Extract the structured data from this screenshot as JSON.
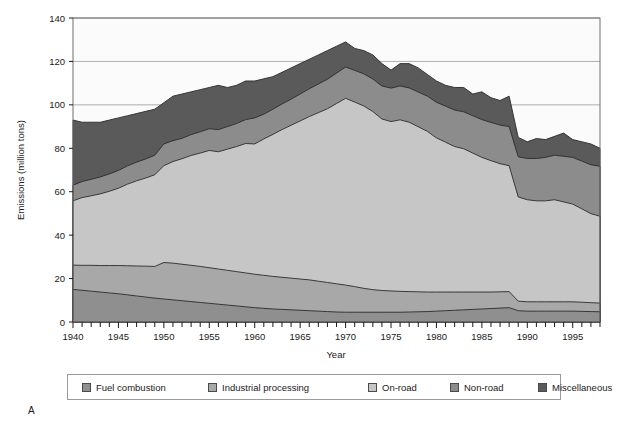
{
  "figure": {
    "panel_label": "A"
  },
  "chart_data": {
    "type": "area",
    "stacked": true,
    "title": "",
    "xlabel": "Year",
    "ylabel": "Emissions (million tons)",
    "xlim": [
      1940,
      1998
    ],
    "ylim": [
      0,
      140
    ],
    "ytick_step": 20,
    "yticks": [
      0,
      20,
      40,
      60,
      80,
      100,
      120,
      140
    ],
    "xticks": [
      1940,
      1945,
      1950,
      1955,
      1960,
      1965,
      1970,
      1975,
      1980,
      1985,
      1990,
      1995
    ],
    "xtick_minor_step": 1,
    "grid": "horizontal",
    "legend_position": "below",
    "x": [
      1940,
      1941,
      1942,
      1943,
      1944,
      1945,
      1946,
      1947,
      1948,
      1949,
      1950,
      1951,
      1952,
      1953,
      1954,
      1955,
      1956,
      1957,
      1958,
      1959,
      1960,
      1961,
      1962,
      1963,
      1964,
      1965,
      1966,
      1967,
      1968,
      1969,
      1970,
      1971,
      1972,
      1973,
      1974,
      1975,
      1976,
      1977,
      1978,
      1979,
      1980,
      1981,
      1982,
      1983,
      1984,
      1985,
      1986,
      1987,
      1988,
      1989,
      1990,
      1991,
      1992,
      1993,
      1994,
      1995,
      1996,
      1997,
      1998
    ],
    "series": [
      {
        "name": "Fuel combustion",
        "color": "#8f8f8f",
        "values": [
          15.0,
          14.6,
          14.2,
          13.8,
          13.4,
          13.0,
          12.5,
          12.0,
          11.5,
          11.0,
          10.6,
          10.2,
          9.8,
          9.4,
          9.0,
          8.6,
          8.2,
          7.8,
          7.4,
          7.0,
          6.6,
          6.3,
          6.0,
          5.8,
          5.6,
          5.4,
          5.2,
          5.0,
          4.8,
          4.6,
          4.5,
          4.5,
          4.5,
          4.5,
          4.5,
          4.5,
          4.5,
          4.6,
          4.7,
          4.8,
          5.0,
          5.2,
          5.4,
          5.6,
          5.8,
          6.0,
          6.2,
          6.4,
          6.6,
          5.2,
          5.0,
          5.0,
          5.0,
          5.0,
          5.0,
          5.0,
          4.9,
          4.8,
          4.7
        ]
      },
      {
        "name": "Industrial processing",
        "color": "#a8a8a8",
        "values": [
          11.2,
          11.5,
          11.9,
          12.2,
          12.6,
          13.0,
          13.4,
          13.8,
          14.2,
          14.6,
          16.8,
          16.9,
          16.8,
          16.7,
          16.6,
          16.4,
          16.2,
          16.0,
          15.8,
          15.6,
          15.4,
          15.2,
          15.0,
          14.8,
          14.6,
          14.4,
          14.2,
          13.8,
          13.4,
          13.0,
          12.5,
          11.8,
          11.0,
          10.4,
          10.0,
          9.8,
          9.6,
          9.4,
          9.2,
          9.0,
          8.8,
          8.6,
          8.4,
          8.2,
          8.0,
          7.8,
          7.6,
          7.5,
          7.4,
          4.4,
          4.3,
          4.3,
          4.3,
          4.3,
          4.3,
          4.3,
          4.2,
          4.1,
          4.0
        ]
      },
      {
        "name": "On-road",
        "color": "#c6c6c6",
        "values": [
          29.6,
          31.2,
          32.0,
          33.0,
          34.2,
          35.6,
          37.6,
          39.2,
          40.6,
          42.2,
          44.6,
          46.8,
          48.6,
          50.6,
          52.2,
          54.0,
          54.0,
          55.8,
          57.6,
          59.6,
          60.0,
          62.8,
          65.4,
          68.0,
          70.4,
          72.8,
          75.2,
          77.6,
          80.0,
          83.0,
          86.0,
          85.0,
          84.0,
          82.0,
          79.0,
          78.0,
          79.0,
          78.0,
          76.0,
          74.0,
          71.0,
          69.0,
          67.0,
          66.0,
          64.0,
          62.0,
          60.5,
          59.0,
          58.0,
          48.0,
          47.0,
          46.5,
          46.5,
          47.0,
          46.0,
          45.0,
          43.0,
          41.0,
          40.0
        ]
      },
      {
        "name": "Non-road",
        "color": "#8c8c8c",
        "values": [
          7.2,
          7.4,
          7.6,
          7.8,
          8.0,
          8.2,
          8.4,
          8.6,
          8.8,
          9.0,
          10.0,
          9.6,
          9.4,
          9.6,
          9.8,
          10.0,
          10.2,
          10.4,
          10.6,
          11.0,
          12.0,
          11.4,
          11.6,
          11.8,
          12.0,
          12.4,
          12.8,
          13.2,
          13.6,
          14.0,
          14.4,
          14.6,
          14.8,
          15.0,
          15.2,
          15.4,
          15.6,
          15.8,
          16.0,
          16.2,
          16.4,
          16.6,
          16.8,
          17.0,
          17.2,
          17.4,
          17.6,
          17.8,
          18.0,
          18.5,
          19.0,
          19.5,
          20.0,
          20.5,
          21.0,
          21.5,
          22.0,
          22.5,
          23.0
        ]
      },
      {
        "name": "Miscellaneous",
        "color": "#5a5a5a",
        "values": [
          30.0,
          27.3,
          26.3,
          25.2,
          24.8,
          24.2,
          23.1,
          22.4,
          21.9,
          21.2,
          19.0,
          20.5,
          20.4,
          19.7,
          19.4,
          19.0,
          20.4,
          18.0,
          17.6,
          17.8,
          17.0,
          16.3,
          15.0,
          14.6,
          14.4,
          14.0,
          13.6,
          13.4,
          13.2,
          12.4,
          11.6,
          10.1,
          10.7,
          11.1,
          10.3,
          8.3,
          10.3,
          11.2,
          11.1,
          10.0,
          9.8,
          9.6,
          10.4,
          11.2,
          10.0,
          12.8,
          11.4,
          11.3,
          14.0,
          8.9,
          7.7,
          9.2,
          8.2,
          8.7,
          10.7,
          8.2,
          8.9,
          9.6,
          8.3
        ]
      }
    ]
  },
  "legend": {
    "items": [
      {
        "label": "Fuel combustion",
        "color": "#8f8f8f"
      },
      {
        "label": "Industrial processing",
        "color": "#a8a8a8"
      },
      {
        "label": "On-road",
        "color": "#c6c6c6"
      },
      {
        "label": "Non-road",
        "color": "#8c8c8c"
      },
      {
        "label": "Miscellaneous",
        "color": "#5a5a5a"
      }
    ]
  }
}
